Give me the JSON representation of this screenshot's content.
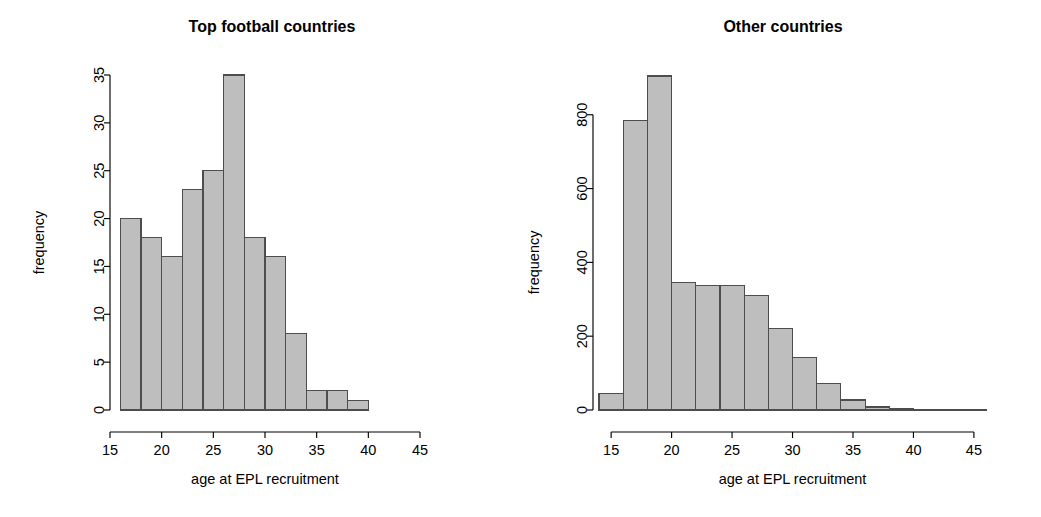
{
  "figure": {
    "background_color": "#ffffff",
    "bar_fill_color": "#bebebe",
    "bar_border_color": "#4d4d4d",
    "axis_color": "#000000"
  },
  "chart_data": [
    {
      "type": "bar",
      "panel": "left",
      "title": "Top football countries",
      "xlabel": "age at EPL recruitment",
      "ylabel": "frequency",
      "bin_width": 2,
      "bin_edges": [
        16,
        18,
        20,
        22,
        24,
        26,
        28,
        30,
        32,
        34,
        36,
        38,
        40
      ],
      "categories": [
        "16-18",
        "18-20",
        "20-22",
        "22-24",
        "24-26",
        "26-28",
        "28-30",
        "30-32",
        "32-34",
        "34-36",
        "36-38",
        "38-40"
      ],
      "values": [
        20,
        18,
        16,
        23,
        25,
        35,
        18,
        16,
        8,
        2,
        2,
        1
      ],
      "xlim": [
        15,
        45
      ],
      "ylim": [
        0,
        35
      ],
      "xticks": [
        15,
        20,
        25,
        30,
        35,
        40,
        45
      ],
      "xtick_labels": [
        "15",
        "20",
        "25",
        "30",
        "35",
        "40",
        "45"
      ],
      "yticks": [
        0,
        5,
        10,
        15,
        20,
        25,
        30,
        35
      ],
      "ytick_labels": [
        "0",
        "5",
        "10",
        "15",
        "20",
        "25",
        "30",
        "35"
      ],
      "grid": false,
      "legend": "none"
    },
    {
      "type": "bar",
      "panel": "right",
      "title": "Other countries",
      "xlabel": "age at EPL recruitment",
      "ylabel": "frequency",
      "bin_width": 2,
      "bin_edges": [
        14,
        16,
        18,
        20,
        22,
        24,
        26,
        28,
        30,
        32,
        34,
        36,
        38,
        40,
        42,
        44,
        46
      ],
      "categories": [
        "14-16",
        "16-18",
        "18-20",
        "20-22",
        "22-24",
        "24-26",
        "26-28",
        "28-30",
        "30-32",
        "32-34",
        "34-36",
        "36-38",
        "38-40",
        "40-42",
        "42-44",
        "44-46"
      ],
      "values": [
        45,
        785,
        905,
        345,
        338,
        338,
        310,
        222,
        143,
        72,
        27,
        8,
        3,
        1,
        1,
        1
      ],
      "xlim": [
        13.5,
        46
      ],
      "ylim": [
        0,
        905
      ],
      "xticks": [
        15,
        20,
        25,
        30,
        35,
        40,
        45
      ],
      "xtick_labels": [
        "15",
        "20",
        "25",
        "30",
        "35",
        "40",
        "45"
      ],
      "yticks": [
        0,
        200,
        400,
        600,
        800
      ],
      "ytick_labels": [
        "0",
        "200",
        "400",
        "600",
        "800"
      ],
      "grid": false,
      "legend": "none"
    }
  ]
}
